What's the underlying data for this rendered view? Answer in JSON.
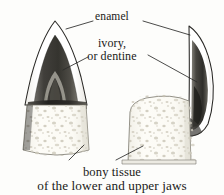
{
  "figure": {
    "background_color": "#fdfdfb",
    "ink_color": "#1a1a18",
    "labels": {
      "enamel": "enamel",
      "dentine_line1": "ivory,",
      "dentine_line2": "or dentine"
    },
    "caption": {
      "line1": "bony tissue",
      "line2": "of the lower and upper jaws"
    },
    "anatomy": {
      "enamel_color": "#ffffff",
      "enamel_outline_color": "#2a2a28",
      "dentine_color": "#4a4a48",
      "dentine_dark_color": "#33322f",
      "pulp_color": "#8e8d88",
      "bone_color": "#fbfaf5",
      "bone_stipple_color": "#b9b5a8",
      "leader_line_color": "#2b2b29"
    },
    "parts": [
      {
        "name": "enamel",
        "description": "outer white cap of the tooth crown"
      },
      {
        "name": "ivory, or dentine",
        "description": "dark inner body of the tooth"
      },
      {
        "name": "bony tissue",
        "description": "stippled jaw bone of the lower and upper jaws"
      }
    ]
  }
}
